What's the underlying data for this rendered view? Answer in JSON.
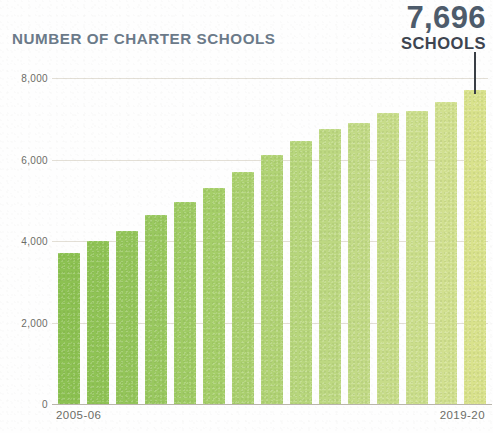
{
  "header": {
    "title": "NUMBER OF CHARTER SCHOOLS",
    "callout_value": "7,696",
    "callout_unit": "SCHOOLS"
  },
  "colors": {
    "title": "#6b7a89",
    "callout_value": "#4d5b6b",
    "callout_unit": "#3d4450",
    "bar_start": "#8cc152",
    "bar_end": "#d9e28c",
    "axis": "#b9b5ab",
    "gridline": "#ded9cf",
    "tick_text": "#6c6c66",
    "pointer": "#3a3f46"
  },
  "axis": {
    "y_ticks": [
      "0",
      "2,000",
      "4,000",
      "6,000",
      "8,000"
    ],
    "x_first_label": "2005-06",
    "x_last_label": "2019-20"
  },
  "chart_data": {
    "type": "bar",
    "title": "NUMBER OF CHARTER SCHOOLS",
    "subtitle": "",
    "xlabel": "",
    "ylabel": "",
    "ylim": [
      0,
      8000
    ],
    "ytick_values": [
      0,
      2000,
      4000,
      6000,
      8000
    ],
    "ytick_labels": [
      "0",
      "2,000",
      "4,000",
      "6,000",
      "8,000"
    ],
    "grid": true,
    "legend": null,
    "annotations": [
      {
        "text": "7,696",
        "sublabel": "SCHOOLS",
        "points_to_category": "2019-20"
      }
    ],
    "categories": [
      "2005-06",
      "2006-07",
      "2007-08",
      "2008-09",
      "2009-10",
      "2010-11",
      "2011-12",
      "2012-13",
      "2013-14",
      "2014-15",
      "2015-16",
      "2016-17",
      "2017-18",
      "2018-19",
      "2019-20"
    ],
    "values": [
      3700,
      4000,
      4250,
      4650,
      4950,
      5300,
      5700,
      6100,
      6450,
      6750,
      6900,
      7150,
      7200,
      7400,
      7696
    ],
    "bar_colors": [
      "#8cc152",
      "#8fc355",
      "#94c55a",
      "#99c85f",
      "#9fcb64",
      "#a5ce69",
      "#abd06f",
      "#b1d375",
      "#b7d67c",
      "#bdd882",
      "#c2da86",
      "#c7dc89",
      "#cbde8c",
      "#d1e08f",
      "#d9e28c"
    ]
  }
}
